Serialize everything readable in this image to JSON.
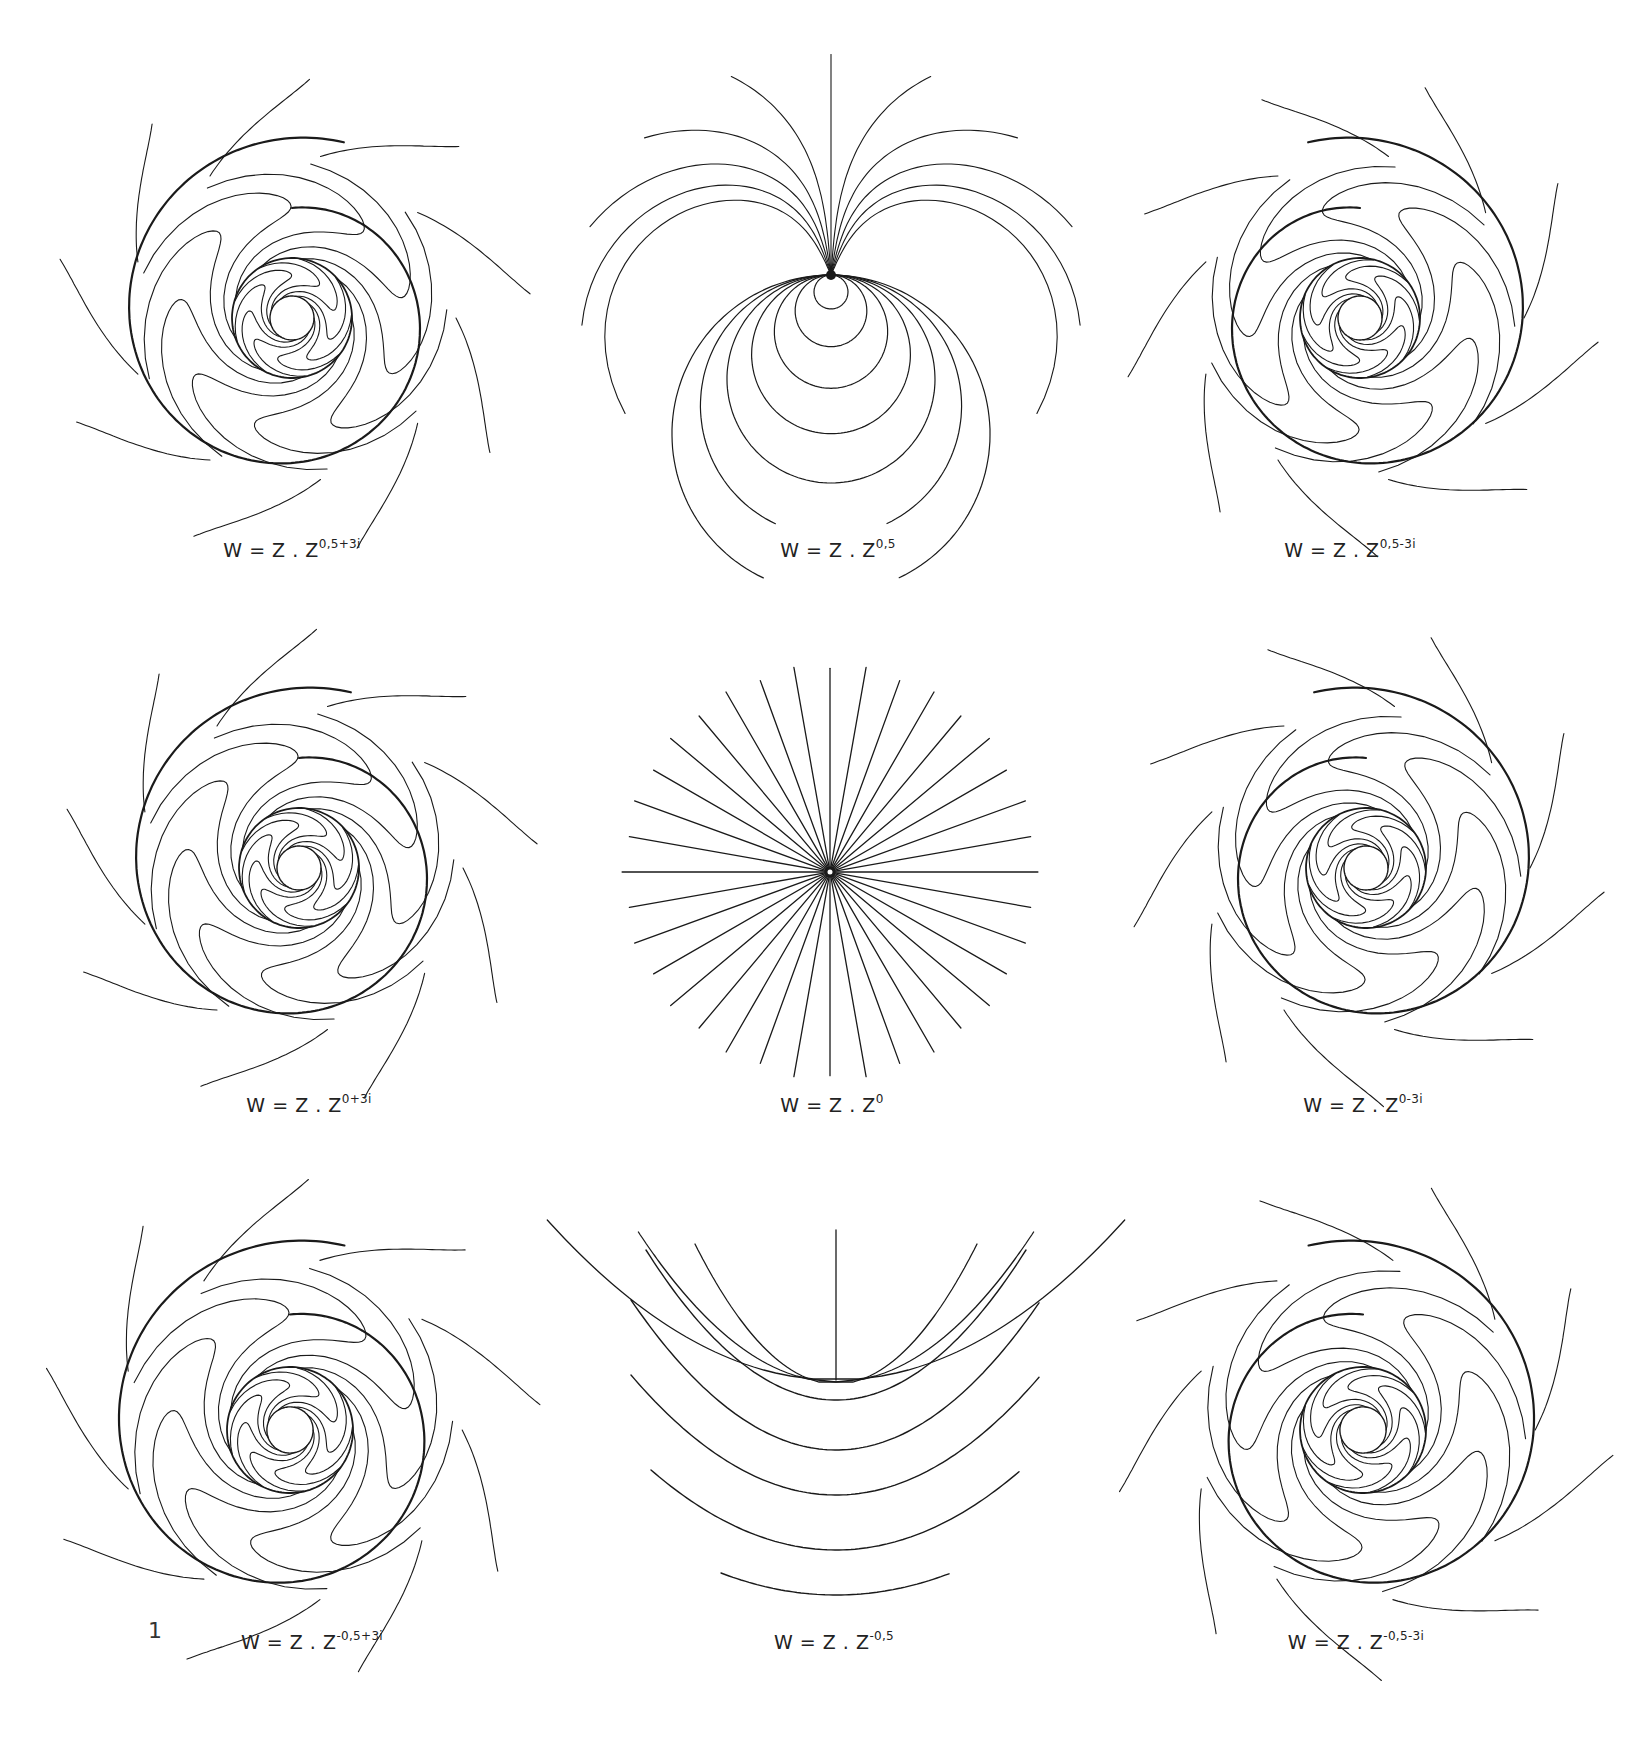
{
  "figure": {
    "number": "1",
    "number_pos": [
      148,
      1632
    ],
    "stroke_color": "#1a1a1a",
    "background": "#ffffff"
  },
  "panels": [
    {
      "id": "p11",
      "row": 1,
      "col": 1,
      "caption_base": "W = Z . Z",
      "caption_exp": "0,5+3i",
      "exp_re": 0.5,
      "exp_im": 3,
      "center": [
        292,
        318
      ],
      "radius": 200,
      "caption_pos": [
        292,
        553
      ],
      "kind": "spiral",
      "sense": 1
    },
    {
      "id": "p12",
      "row": 1,
      "col": 2,
      "caption_base": "W = Z . Z",
      "caption_exp": "0,5",
      "exp_re": 0.5,
      "exp_im": 0,
      "center": [
        831,
        305
      ],
      "radius": 210,
      "caption_pos": [
        838,
        553
      ],
      "kind": "loops"
    },
    {
      "id": "p13",
      "row": 1,
      "col": 3,
      "caption_base": "W = Z . Z",
      "caption_exp": "0,5-3i",
      "exp_re": 0.5,
      "exp_im": -3,
      "center": [
        1360,
        318
      ],
      "radius": 200,
      "caption_pos": [
        1350,
        553
      ],
      "kind": "spiral",
      "sense": -1
    },
    {
      "id": "p21",
      "row": 2,
      "col": 1,
      "caption_base": "W = Z . Z",
      "caption_exp": "0+3i",
      "exp_re": 0,
      "exp_im": 3,
      "center": [
        299,
        868
      ],
      "radius": 200,
      "caption_pos": [
        309,
        1108
      ],
      "kind": "spiral",
      "sense": 1
    },
    {
      "id": "p22",
      "row": 2,
      "col": 2,
      "caption_base": "W = Z . Z",
      "caption_exp": "0",
      "exp_re": 0,
      "exp_im": 0,
      "center": [
        830,
        872
      ],
      "radius": 210,
      "caption_pos": [
        832,
        1108
      ],
      "kind": "rays",
      "ray_count": 36
    },
    {
      "id": "p23",
      "row": 2,
      "col": 3,
      "caption_base": "W = Z . Z",
      "caption_exp": "0-3i",
      "exp_re": 0,
      "exp_im": -3,
      "center": [
        1366,
        868
      ],
      "radius": 200,
      "caption_pos": [
        1363,
        1108
      ],
      "kind": "spiral",
      "sense": -1
    },
    {
      "id": "p31",
      "row": 3,
      "col": 1,
      "caption_base": "W = Z . Z",
      "caption_exp": "-0,5+3i",
      "exp_re": -0.5,
      "exp_im": 3,
      "center": [
        290,
        1430
      ],
      "radius": 210,
      "caption_pos": [
        312,
        1645
      ],
      "kind": "spiral",
      "sense": 1
    },
    {
      "id": "p32",
      "row": 3,
      "col": 2,
      "caption_base": "W = Z . Z",
      "caption_exp": "-0,5",
      "exp_re": -0.5,
      "exp_im": 0,
      "center": [
        836,
        1430
      ],
      "radius": 210,
      "caption_pos": [
        834,
        1645
      ],
      "kind": "parabolas"
    },
    {
      "id": "p33",
      "row": 3,
      "col": 3,
      "caption_base": "W = Z . Z",
      "caption_exp": "-0,5-3i",
      "exp_re": -0.5,
      "exp_im": -3,
      "center": [
        1363,
        1430
      ],
      "radius": 210,
      "caption_pos": [
        1356,
        1645
      ],
      "kind": "spiral",
      "sense": -1
    }
  ]
}
